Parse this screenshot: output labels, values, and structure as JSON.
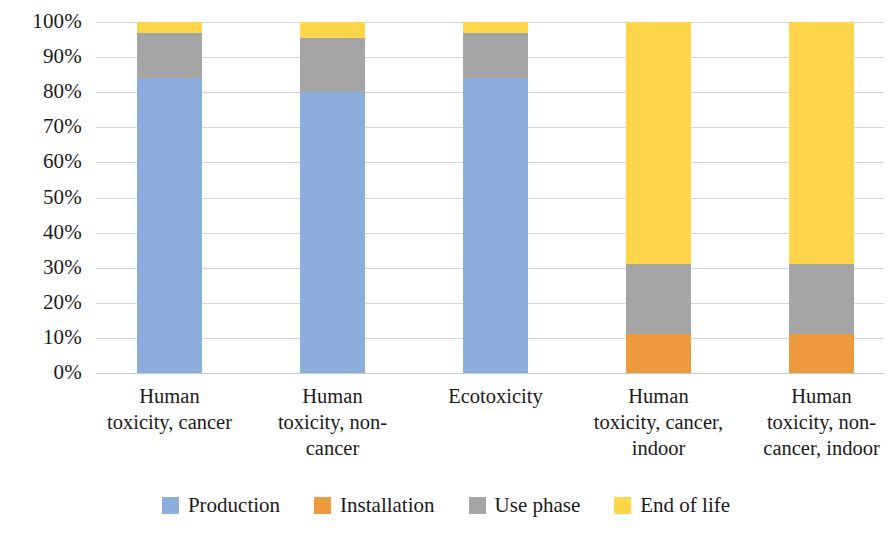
{
  "chart_data": {
    "type": "bar",
    "subtype": "stacked-100-percent",
    "title": "",
    "xlabel": "",
    "ylabel": "",
    "ylim": [
      0,
      100
    ],
    "grid": true,
    "legend_position": "bottom",
    "categories": [
      "Human\ntoxicity, cancer",
      "Human\ntoxicity, non-\ncancer",
      "Ecotoxicity",
      "Human\ntoxicity, cancer,\nindoor",
      "Human\ntoxicity, non-\ncancer, indoor"
    ],
    "y_ticks": [
      "0%",
      "10%",
      "20%",
      "30%",
      "40%",
      "50%",
      "60%",
      "70%",
      "80%",
      "90%",
      "100%"
    ],
    "y_tick_values": [
      0,
      10,
      20,
      30,
      40,
      50,
      60,
      70,
      80,
      90,
      100
    ],
    "series": [
      {
        "name": "Production",
        "color": "#8CAEDC",
        "values": [
          84,
          80,
          84,
          0,
          0
        ]
      },
      {
        "name": "Installation",
        "color": "#ED9A3C",
        "values": [
          0,
          0,
          0,
          11,
          11
        ]
      },
      {
        "name": "Use phase",
        "color": "#A5A5A5",
        "values": [
          13,
          15.5,
          13,
          20,
          20
        ]
      },
      {
        "name": "End of life",
        "color": "#FFD54A",
        "values": [
          3,
          4.5,
          3,
          69,
          69
        ]
      }
    ]
  },
  "legend": {
    "items": [
      {
        "label": "Production",
        "color": "#8CAEDC",
        "icon": "legend-swatch-icon"
      },
      {
        "label": "Installation",
        "color": "#ED9A3C",
        "icon": "legend-swatch-icon"
      },
      {
        "label": "Use phase",
        "color": "#A5A5A5",
        "icon": "legend-swatch-icon"
      },
      {
        "label": "End of life",
        "color": "#FFD54A",
        "icon": "legend-swatch-icon"
      }
    ]
  }
}
